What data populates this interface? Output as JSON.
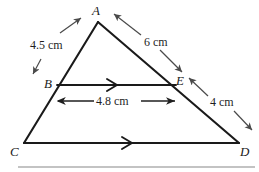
{
  "figure": {
    "type": "geometry-diagram",
    "vertices": [
      {
        "id": "A",
        "label": "A",
        "x": 98,
        "y": 22,
        "label_x": 92,
        "label_y": 6
      },
      {
        "id": "B",
        "label": "B",
        "x": 57,
        "y": 85,
        "label_x": 44,
        "label_y": 79
      },
      {
        "id": "C",
        "label": "C",
        "x": 24,
        "y": 143,
        "label_x": 10,
        "label_y": 146
      },
      {
        "id": "D",
        "label": "D",
        "x": 239,
        "y": 143,
        "label_x": 240,
        "label_y": 146
      },
      {
        "id": "E",
        "label": "E",
        "x": 176,
        "y": 85,
        "label_x": 176,
        "label_y": 74
      }
    ],
    "sides": [
      {
        "id": "AC",
        "from": "A",
        "to": "C"
      },
      {
        "id": "AD",
        "from": "A",
        "to": "D"
      },
      {
        "id": "CD",
        "from": "C",
        "to": "D"
      },
      {
        "id": "BE",
        "from": "B",
        "to": "E"
      }
    ],
    "parallel_marks": [
      {
        "id": "mark-BE",
        "segment": "BE",
        "x": 113,
        "y": 85
      },
      {
        "id": "mark-CD",
        "segment": "CD",
        "x": 128,
        "y": 143
      }
    ],
    "measurements": [
      {
        "id": "AB",
        "value": "4.5",
        "unit": "cm",
        "text": "4.5 cm",
        "segment": "A to B",
        "label_x": 30,
        "label_y": 39,
        "arrow": {
          "x1": 60,
          "y1": 33,
          "x2": 81,
          "y2": 18,
          "x3": 41,
          "y3": 59,
          "x4": 33,
          "y4": 73
        }
      },
      {
        "id": "AE",
        "value": "6",
        "unit": "cm",
        "text": "6 cm",
        "segment": "A to E",
        "label_x": 144,
        "label_y": 36,
        "arrow": {
          "x1": 141,
          "y1": 36,
          "x2": 115,
          "y2": 15,
          "x3": 176,
          "y3": 47,
          "x4": 184,
          "y4": 73
        }
      },
      {
        "id": "ED",
        "value": "4",
        "unit": "cm",
        "text": "4 cm",
        "segment": "E to D",
        "label_x": 210,
        "label_y": 96,
        "arrow": {
          "x1": 208,
          "y1": 97,
          "x2": 190,
          "y2": 79,
          "x3": 238,
          "y3": 112,
          "x4": 252,
          "y4": 130
        }
      },
      {
        "id": "BE",
        "value": "4.8",
        "unit": "cm",
        "text": "4.8 cm",
        "segment": "B to E",
        "label_x": 92,
        "label_y": 94,
        "dimension_line": {
          "x1": 57,
          "y1": 101,
          "x2": 176,
          "y2": 101
        }
      }
    ],
    "rule": {
      "id": "bottom-rule",
      "x1": 18,
      "y1": 167,
      "x2": 255,
      "y2": 167
    }
  },
  "colors": {
    "stroke": "#1a1a1a",
    "arrow": "#4a4a4a",
    "rule": "#888888",
    "background": "#ffffff"
  }
}
